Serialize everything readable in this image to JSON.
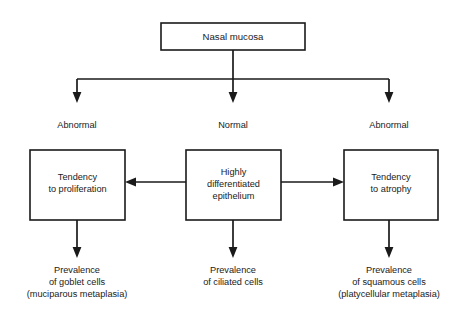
{
  "diagram": {
    "title_node": {
      "label": "Nasal mucosa"
    },
    "branch_labels": [
      {
        "label": "Abnormal"
      },
      {
        "label": "Normal"
      },
      {
        "label": "Abnormal"
      }
    ],
    "state_boxes": [
      {
        "lines": [
          "Tendency",
          "to proliferation"
        ]
      },
      {
        "lines": [
          "Highly",
          "differentiated",
          "epithelium"
        ]
      },
      {
        "lines": [
          "Tendency",
          "to atrophy"
        ]
      }
    ],
    "outcomes": [
      {
        "lines": [
          "Prevalence",
          "of goblet cells",
          "(muciparous metaplasia)"
        ]
      },
      {
        "lines": [
          "Prevalence",
          "of ciliated cells"
        ]
      },
      {
        "lines": [
          "Prevalence",
          "of squamous cells",
          "(platycellular metaplasia)"
        ]
      }
    ],
    "colors": {
      "line": "#1a1a1a",
      "text": "#1a1a1a",
      "background": "#ffffff",
      "box_fill": "#ffffff"
    }
  }
}
